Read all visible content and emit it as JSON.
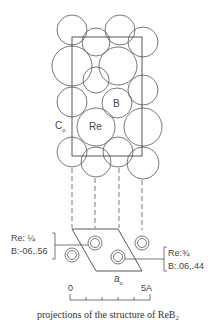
{
  "figure": {
    "labels": {
      "c0": "C",
      "c0_sub": "o",
      "re": "Re",
      "b": "B",
      "a0": "a",
      "a0_sub": "o"
    },
    "left_annotation": {
      "line1": "Re: ¼",
      "line2": "B:-06,.56"
    },
    "right_annotation": {
      "line1": "Re:¾",
      "line2": "B:.06,.44"
    },
    "scale_bar": {
      "start_label": "0",
      "end_label": "5A"
    },
    "caption": "projections of the structure of ReB₂"
  }
}
